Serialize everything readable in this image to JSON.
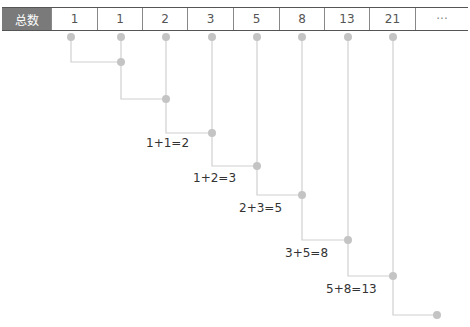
{
  "table": {
    "header": "总数",
    "values": [
      "1",
      "1",
      "2",
      "3",
      "5",
      "8",
      "13",
      "21",
      "···"
    ]
  },
  "equations": [
    "1+1=2",
    "1+2=3",
    "2+3=5",
    "3+5=8",
    "5+8=13"
  ],
  "colors": {
    "header_bg": "#7a7a7a",
    "line": "#d0d0d0",
    "dot": "#c4c4c4",
    "border": "#555555"
  }
}
